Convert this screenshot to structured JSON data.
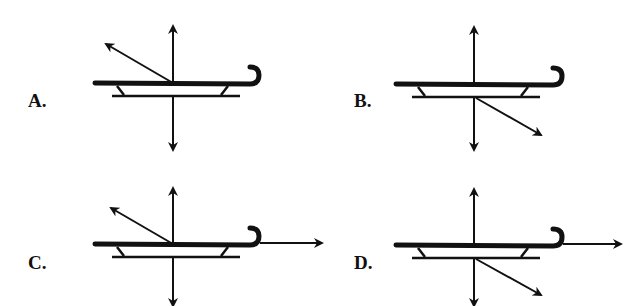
{
  "figure": {
    "options": [
      {
        "label": "A.",
        "arrows": [
          "up",
          "down",
          "up-left"
        ]
      },
      {
        "label": "B.",
        "arrows": [
          "up",
          "down",
          "down-right"
        ]
      },
      {
        "label": "C.",
        "arrows": [
          "up",
          "down",
          "up-left",
          "right"
        ]
      },
      {
        "label": "D.",
        "arrows": [
          "up",
          "down",
          "down-right",
          "right"
        ]
      }
    ]
  },
  "colors": {
    "ink": "#111111",
    "background": "#ffffff"
  }
}
